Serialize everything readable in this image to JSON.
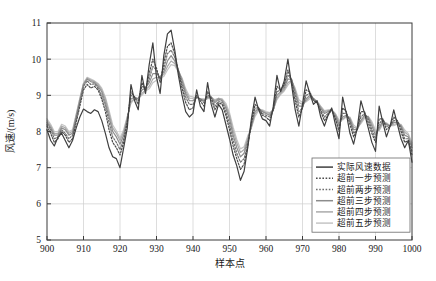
{
  "chart_data": {
    "type": "line",
    "title": "",
    "xlabel": "样本点",
    "ylabel": "风速/(m/s)",
    "xlim": [
      900,
      1000
    ],
    "ylim": [
      5,
      11
    ],
    "xticks": [
      900,
      910,
      920,
      930,
      940,
      950,
      960,
      970,
      980,
      990,
      1000
    ],
    "yticks": [
      5,
      6,
      7,
      8,
      9,
      10,
      11
    ],
    "grid": true,
    "legend_position": "lower-right",
    "x": [
      900,
      901,
      902,
      903,
      904,
      905,
      906,
      907,
      908,
      909,
      910,
      911,
      912,
      913,
      914,
      915,
      916,
      917,
      918,
      919,
      920,
      921,
      922,
      923,
      924,
      925,
      926,
      927,
      928,
      929,
      930,
      931,
      932,
      933,
      934,
      935,
      936,
      937,
      938,
      939,
      940,
      941,
      942,
      943,
      944,
      945,
      946,
      947,
      948,
      949,
      950,
      951,
      952,
      953,
      954,
      955,
      956,
      957,
      958,
      959,
      960,
      961,
      962,
      963,
      964,
      965,
      966,
      967,
      968,
      969,
      970,
      971,
      972,
      973,
      974,
      975,
      976,
      977,
      978,
      979,
      980,
      981,
      982,
      983,
      984,
      985,
      986,
      987,
      988,
      989,
      990,
      991,
      992,
      993,
      994,
      995,
      996,
      997,
      998,
      999,
      1000
    ],
    "series": [
      {
        "name": "实际风速数据",
        "style": "solid",
        "color": "#3f3f3f",
        "width": 1.2,
        "values": [
          8.05,
          7.75,
          7.6,
          7.85,
          7.95,
          7.75,
          7.55,
          7.75,
          8.1,
          8.4,
          8.62,
          8.55,
          8.5,
          8.6,
          8.55,
          8.3,
          7.95,
          7.55,
          7.3,
          7.25,
          7.0,
          7.55,
          8.1,
          9.3,
          8.85,
          8.6,
          9.55,
          9.05,
          9.85,
          10.45,
          9.5,
          9.05,
          10.1,
          10.7,
          10.8,
          10.25,
          9.55,
          9.0,
          8.55,
          8.4,
          8.5,
          9.15,
          8.7,
          8.55,
          9.35,
          8.75,
          8.4,
          8.75,
          8.6,
          8.2,
          7.8,
          7.35,
          7.05,
          6.65,
          6.9,
          7.55,
          8.35,
          8.95,
          8.6,
          8.35,
          8.3,
          8.15,
          8.7,
          9.55,
          9.1,
          9.4,
          10.0,
          9.3,
          8.6,
          8.15,
          8.75,
          9.4,
          9.05,
          8.75,
          8.85,
          8.4,
          8.15,
          8.45,
          8.65,
          8.2,
          7.8,
          8.95,
          8.5,
          7.95,
          7.65,
          8.1,
          8.85,
          8.5,
          8.1,
          7.7,
          7.45,
          8.7,
          8.25,
          7.85,
          8.15,
          8.6,
          8.2,
          7.8,
          7.55,
          7.75,
          7.15
        ]
      },
      {
        "name": "超前一步预测",
        "style": "dotted",
        "color": "#4a4a4a",
        "width": 1.2,
        "values": [
          8.15,
          7.95,
          7.7,
          7.8,
          8.0,
          7.9,
          7.7,
          7.8,
          8.25,
          8.7,
          9.15,
          9.3,
          9.2,
          9.25,
          9.15,
          8.9,
          8.55,
          8.05,
          7.7,
          7.55,
          7.35,
          7.7,
          8.25,
          9.1,
          8.95,
          8.75,
          9.35,
          9.15,
          9.6,
          10.0,
          9.75,
          9.35,
          9.9,
          10.35,
          10.45,
          10.15,
          9.65,
          9.2,
          8.8,
          8.6,
          8.65,
          9.0,
          8.85,
          8.7,
          9.1,
          8.9,
          8.6,
          8.8,
          8.75,
          8.45,
          8.05,
          7.6,
          7.25,
          6.95,
          7.1,
          7.6,
          8.25,
          8.75,
          8.65,
          8.45,
          8.4,
          8.3,
          8.6,
          9.25,
          9.15,
          9.3,
          9.7,
          9.4,
          8.85,
          8.4,
          8.65,
          9.15,
          9.1,
          8.85,
          8.8,
          8.55,
          8.3,
          8.45,
          8.6,
          8.35,
          8.0,
          8.65,
          8.55,
          8.2,
          7.85,
          8.05,
          8.55,
          8.55,
          8.25,
          7.95,
          7.7,
          8.35,
          8.35,
          8.05,
          8.15,
          8.4,
          8.3,
          8.0,
          7.7,
          7.75,
          7.35
        ]
      },
      {
        "name": "超前两步预测",
        "style": "dotted",
        "color": "#6e6e6e",
        "width": 1.2,
        "values": [
          8.2,
          8.05,
          7.8,
          7.85,
          8.05,
          7.95,
          7.8,
          7.9,
          8.35,
          8.8,
          9.25,
          9.4,
          9.3,
          9.32,
          9.2,
          9.0,
          8.7,
          8.25,
          7.85,
          7.7,
          7.5,
          7.8,
          8.3,
          9.0,
          8.95,
          8.85,
          9.25,
          9.2,
          9.45,
          9.8,
          9.7,
          9.45,
          9.75,
          10.15,
          10.25,
          10.05,
          9.7,
          9.3,
          8.95,
          8.75,
          8.75,
          8.95,
          8.9,
          8.8,
          9.0,
          8.95,
          8.7,
          8.85,
          8.8,
          8.55,
          8.2,
          7.75,
          7.4,
          7.15,
          7.25,
          7.65,
          8.2,
          8.65,
          8.65,
          8.5,
          8.45,
          8.4,
          8.6,
          9.1,
          9.15,
          9.25,
          9.55,
          9.45,
          9.0,
          8.55,
          8.65,
          9.0,
          9.05,
          8.9,
          8.8,
          8.6,
          8.4,
          8.5,
          8.6,
          8.4,
          8.1,
          8.5,
          8.5,
          8.3,
          7.95,
          8.05,
          8.4,
          8.5,
          8.35,
          8.05,
          7.8,
          8.2,
          8.35,
          8.15,
          8.15,
          8.3,
          8.3,
          8.1,
          7.8,
          7.8,
          7.45
        ]
      },
      {
        "name": "超前三步预测",
        "style": "solid",
        "color": "#8c8c8c",
        "width": 1.2,
        "values": [
          8.25,
          8.1,
          7.9,
          7.9,
          8.1,
          8.05,
          7.9,
          7.95,
          8.4,
          8.85,
          9.3,
          9.45,
          9.38,
          9.35,
          9.25,
          9.1,
          8.8,
          8.4,
          8.0,
          7.85,
          7.65,
          7.9,
          8.35,
          8.9,
          8.95,
          8.9,
          9.15,
          9.2,
          9.35,
          9.6,
          9.6,
          9.5,
          9.65,
          9.95,
          10.1,
          9.95,
          9.7,
          9.4,
          9.05,
          8.85,
          8.85,
          8.95,
          8.9,
          8.85,
          8.95,
          8.95,
          8.8,
          8.9,
          8.85,
          8.65,
          8.35,
          7.9,
          7.55,
          7.3,
          7.4,
          7.75,
          8.15,
          8.55,
          8.65,
          8.55,
          8.5,
          8.45,
          8.6,
          9.0,
          9.1,
          9.2,
          9.45,
          9.45,
          9.1,
          8.7,
          8.7,
          8.9,
          9.0,
          8.9,
          8.8,
          8.65,
          8.5,
          8.55,
          8.6,
          8.45,
          8.2,
          8.4,
          8.45,
          8.35,
          8.05,
          8.05,
          8.3,
          8.45,
          8.4,
          8.15,
          7.9,
          8.1,
          8.3,
          8.2,
          8.15,
          8.25,
          8.25,
          8.15,
          7.9,
          7.85,
          7.55
        ]
      },
      {
        "name": "超前四步预测",
        "style": "solid",
        "color": "#aaaaaa",
        "width": 1.2,
        "values": [
          8.3,
          8.15,
          7.95,
          7.95,
          8.15,
          8.1,
          7.95,
          8.0,
          8.45,
          8.9,
          9.32,
          9.48,
          9.42,
          9.38,
          9.3,
          9.15,
          8.9,
          8.5,
          8.1,
          7.95,
          7.75,
          7.98,
          8.4,
          8.82,
          8.92,
          8.92,
          9.05,
          9.15,
          9.25,
          9.45,
          9.5,
          9.5,
          9.58,
          9.8,
          9.95,
          9.88,
          9.68,
          9.45,
          9.12,
          8.92,
          8.92,
          8.95,
          8.9,
          8.88,
          8.92,
          8.95,
          8.85,
          8.92,
          8.88,
          8.72,
          8.45,
          8.02,
          7.68,
          7.42,
          7.5,
          7.82,
          8.12,
          8.48,
          8.62,
          8.58,
          8.52,
          8.5,
          8.6,
          8.92,
          9.05,
          9.15,
          9.35,
          9.42,
          9.15,
          8.8,
          8.75,
          8.85,
          8.95,
          8.92,
          8.82,
          8.68,
          8.55,
          8.58,
          8.6,
          8.48,
          8.28,
          8.35,
          8.42,
          8.38,
          8.12,
          8.08,
          8.25,
          8.4,
          8.42,
          8.22,
          7.98,
          8.05,
          8.25,
          8.22,
          8.15,
          8.2,
          8.22,
          8.18,
          7.98,
          7.9,
          7.62
        ]
      },
      {
        "name": "超前五步预测",
        "style": "solid",
        "color": "#c4c4c4",
        "width": 1.2,
        "values": [
          8.35,
          8.2,
          8.0,
          8.0,
          8.2,
          8.15,
          8.0,
          8.05,
          8.48,
          8.92,
          9.34,
          9.5,
          9.45,
          9.4,
          9.33,
          9.2,
          8.95,
          8.58,
          8.18,
          8.02,
          7.82,
          8.05,
          8.42,
          8.78,
          8.9,
          8.92,
          9.0,
          9.12,
          9.18,
          9.35,
          9.42,
          9.48,
          9.52,
          9.7,
          9.85,
          9.82,
          9.65,
          9.48,
          9.18,
          8.98,
          8.96,
          8.95,
          8.9,
          8.9,
          8.9,
          8.95,
          8.88,
          8.92,
          8.9,
          8.78,
          8.52,
          8.12,
          7.78,
          7.52,
          7.58,
          7.88,
          8.1,
          8.42,
          8.58,
          8.6,
          8.55,
          8.52,
          8.6,
          8.88,
          9.02,
          9.12,
          9.28,
          9.4,
          9.2,
          8.88,
          8.8,
          8.82,
          8.9,
          8.92,
          8.84,
          8.7,
          8.58,
          8.6,
          8.6,
          8.5,
          8.32,
          8.32,
          8.4,
          8.4,
          8.18,
          8.1,
          8.22,
          8.36,
          8.42,
          8.28,
          8.04,
          8.02,
          8.2,
          8.24,
          8.16,
          8.16,
          8.2,
          8.2,
          8.04,
          7.94,
          7.68
        ]
      }
    ]
  }
}
